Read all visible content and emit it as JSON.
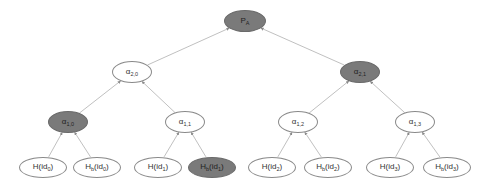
{
  "diagram": {
    "type": "binary-merkle-tree",
    "colors": {
      "filled": "#7a7a7a",
      "empty": "#ffffff",
      "edge": "#b0b0b0",
      "border": "#8a8a8a"
    },
    "nodes": [
      {
        "id": "root",
        "base": "P",
        "sub": "A",
        "filled": true,
        "cx": 245,
        "cy": 21,
        "w": 42,
        "h": 22
      },
      {
        "id": "a20",
        "base": "α",
        "sub": "2,0",
        "filled": false,
        "cx": 132,
        "cy": 72,
        "w": 40,
        "h": 22
      },
      {
        "id": "a21",
        "base": "α",
        "sub": "2,1",
        "filled": true,
        "cx": 360,
        "cy": 72,
        "w": 40,
        "h": 22
      },
      {
        "id": "a10",
        "base": "α",
        "sub": "1,0",
        "filled": true,
        "cx": 68,
        "cy": 122,
        "w": 40,
        "h": 22
      },
      {
        "id": "a11",
        "base": "α",
        "sub": "1,1",
        "filled": false,
        "cx": 185,
        "cy": 122,
        "w": 40,
        "h": 22
      },
      {
        "id": "a12",
        "base": "α",
        "sub": "1,2",
        "filled": false,
        "cx": 298,
        "cy": 122,
        "w": 40,
        "h": 22
      },
      {
        "id": "a13",
        "base": "α",
        "sub": "1,3",
        "filled": false,
        "cx": 415,
        "cy": 122,
        "w": 40,
        "h": 22
      },
      {
        "id": "h0",
        "base": "H(id",
        "sub": "0",
        "tail": ")",
        "filled": false,
        "cx": 43,
        "cy": 167,
        "w": 48,
        "h": 21
      },
      {
        "id": "hb0",
        "base": "H",
        "sub": "b",
        "mid": "(id",
        "sub2": "0",
        "tail": ")",
        "filled": false,
        "cx": 97,
        "cy": 167,
        "w": 48,
        "h": 21
      },
      {
        "id": "h1",
        "base": "H(id",
        "sub": "1",
        "tail": ")",
        "filled": false,
        "cx": 158,
        "cy": 167,
        "w": 48,
        "h": 21
      },
      {
        "id": "hb1",
        "base": "H",
        "sub": "b",
        "mid": "(id",
        "sub2": "1",
        "tail": ")",
        "filled": true,
        "cx": 212,
        "cy": 167,
        "w": 48,
        "h": 21
      },
      {
        "id": "h2",
        "base": "H(id",
        "sub": "2",
        "tail": ")",
        "filled": false,
        "cx": 272,
        "cy": 167,
        "w": 48,
        "h": 21
      },
      {
        "id": "hb2",
        "base": "H",
        "sub": "b",
        "mid": "(id",
        "sub2": "2",
        "tail": ")",
        "filled": false,
        "cx": 328,
        "cy": 167,
        "w": 48,
        "h": 21
      },
      {
        "id": "h3",
        "base": "H(id",
        "sub": "3",
        "tail": ")",
        "filled": false,
        "cx": 390,
        "cy": 167,
        "w": 48,
        "h": 21
      },
      {
        "id": "hb3",
        "base": "H",
        "sub": "b",
        "mid": "(id",
        "sub2": "3",
        "tail": ")",
        "filled": false,
        "cx": 447,
        "cy": 167,
        "w": 48,
        "h": 21
      }
    ],
    "edges": [
      {
        "from": "a20",
        "to": "root"
      },
      {
        "from": "a21",
        "to": "root"
      },
      {
        "from": "a10",
        "to": "a20"
      },
      {
        "from": "a11",
        "to": "a20"
      },
      {
        "from": "a12",
        "to": "a21"
      },
      {
        "from": "a13",
        "to": "a21"
      },
      {
        "from": "h0",
        "to": "a10"
      },
      {
        "from": "hb0",
        "to": "a10"
      },
      {
        "from": "h1",
        "to": "a11"
      },
      {
        "from": "hb1",
        "to": "a11"
      },
      {
        "from": "h2",
        "to": "a12"
      },
      {
        "from": "hb2",
        "to": "a12"
      },
      {
        "from": "h3",
        "to": "a13"
      },
      {
        "from": "hb3",
        "to": "a13"
      }
    ]
  }
}
